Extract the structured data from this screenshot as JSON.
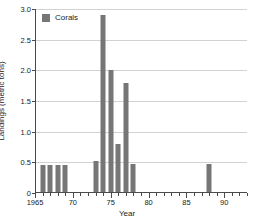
{
  "chart_data": {
    "type": "bar",
    "title": "",
    "xlabel": "Year",
    "ylabel": "Landings (metric tons)",
    "xlim": [
      1965,
      1993
    ],
    "ylim": [
      0,
      3.0
    ],
    "grid": true,
    "legend_position": "top-left",
    "series": [
      {
        "name": "Corals",
        "color": "#767676",
        "x": [
          1966,
          1967,
          1968,
          1969,
          1973,
          1974,
          1975,
          1976,
          1977,
          1978,
          1988
        ],
        "values": [
          0.45,
          0.45,
          0.45,
          0.45,
          0.52,
          2.9,
          2.0,
          0.8,
          1.8,
          0.48,
          0.48
        ]
      }
    ],
    "ytick_labels": [
      "0",
      "0.5",
      "1.0",
      "1.5",
      "2.0",
      "2.5",
      "3.0"
    ],
    "ytick_values": [
      0,
      0.5,
      1.0,
      1.5,
      2.0,
      2.5,
      3.0
    ],
    "xtick_labels": [
      "1965",
      "70",
      "75",
      "80",
      "85",
      "90"
    ],
    "xtick_values": [
      1965,
      1970,
      1975,
      1980,
      1985,
      1990
    ],
    "xminor_step": 1
  },
  "legend": {
    "entries": [
      {
        "label": "Corals",
        "color": "#767676"
      }
    ]
  },
  "colors": {
    "bar": "#767676",
    "grid": "#d2d2d2",
    "axis": "#4a4a4a",
    "background": "#ffffff"
  }
}
